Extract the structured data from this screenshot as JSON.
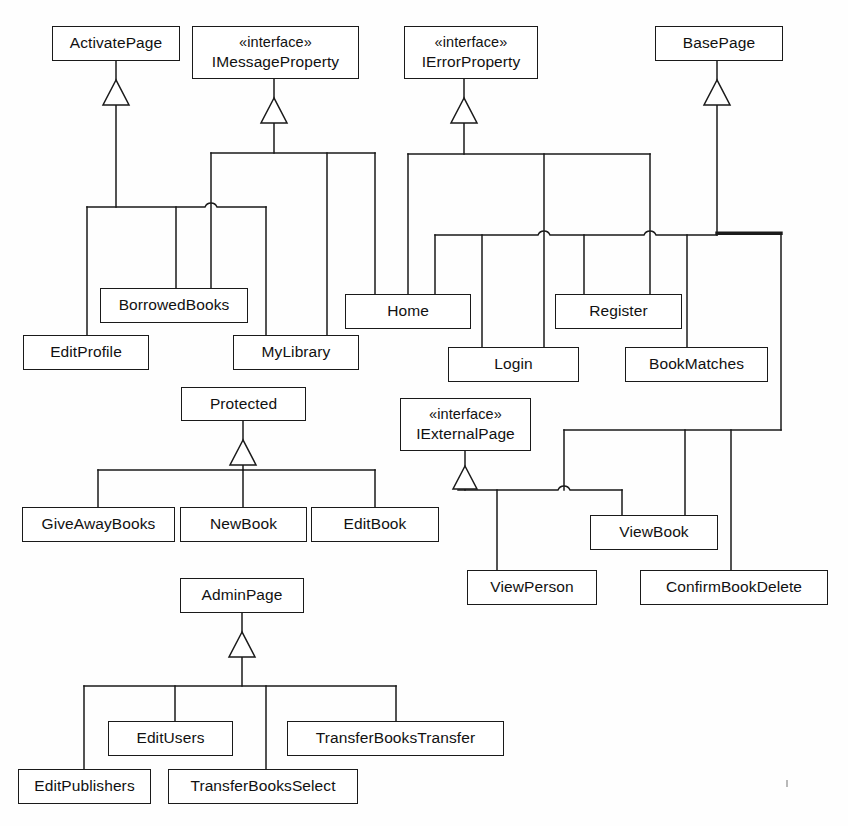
{
  "diagram": {
    "type": "uml-class-inheritance",
    "background_color": "#fefefe",
    "line_color": "#1a1a1a",
    "box_fill": "#ffffff",
    "stereotype_label": "«interface»"
  },
  "nodes": [
    {
      "id": "activatepage",
      "name": "ActivatePage",
      "stereotype": "",
      "kind": "class",
      "x": 52,
      "y": 26,
      "w": 128,
      "h": 35
    },
    {
      "id": "imessageproperty",
      "name": "IMessageProperty",
      "stereotype": "«interface»",
      "kind": "interface",
      "x": 192,
      "y": 26,
      "w": 167,
      "h": 53
    },
    {
      "id": "ierrorproperty",
      "name": "IErrorProperty",
      "stereotype": "«interface»",
      "kind": "interface",
      "x": 404,
      "y": 26,
      "w": 134,
      "h": 53
    },
    {
      "id": "basepage",
      "name": "BasePage",
      "stereotype": "",
      "kind": "class",
      "x": 655,
      "y": 26,
      "w": 128,
      "h": 35
    },
    {
      "id": "borrowedbooks",
      "name": "BorrowedBooks",
      "stereotype": "",
      "kind": "class",
      "x": 100,
      "y": 288,
      "w": 148,
      "h": 35
    },
    {
      "id": "home",
      "name": "Home",
      "stereotype": "",
      "kind": "class",
      "x": 345,
      "y": 294,
      "w": 126,
      "h": 35
    },
    {
      "id": "register",
      "name": "Register",
      "stereotype": "",
      "kind": "class",
      "x": 555,
      "y": 294,
      "w": 127,
      "h": 35
    },
    {
      "id": "editprofile",
      "name": "EditProfile",
      "stereotype": "",
      "kind": "class",
      "x": 23,
      "y": 335,
      "w": 126,
      "h": 35
    },
    {
      "id": "mylibrary",
      "name": "MyLibrary",
      "stereotype": "",
      "kind": "class",
      "x": 233,
      "y": 335,
      "w": 126,
      "h": 35
    },
    {
      "id": "login",
      "name": "Login",
      "stereotype": "",
      "kind": "class",
      "x": 448,
      "y": 347,
      "w": 131,
      "h": 35
    },
    {
      "id": "bookmatches",
      "name": "BookMatches",
      "stereotype": "",
      "kind": "class",
      "x": 625,
      "y": 347,
      "w": 143,
      "h": 35
    },
    {
      "id": "protected",
      "name": "Protected",
      "stereotype": "",
      "kind": "class",
      "x": 181,
      "y": 387,
      "w": 125,
      "h": 34
    },
    {
      "id": "iexternalpage",
      "name": "IExternalPage",
      "stereotype": "«interface»",
      "kind": "interface",
      "x": 400,
      "y": 398,
      "w": 131,
      "h": 53
    },
    {
      "id": "giveawaybooks",
      "name": "GiveAwayBooks",
      "stereotype": "",
      "kind": "class",
      "x": 22,
      "y": 507,
      "w": 153,
      "h": 35
    },
    {
      "id": "newbook",
      "name": "NewBook",
      "stereotype": "",
      "kind": "class",
      "x": 180,
      "y": 507,
      "w": 127,
      "h": 35
    },
    {
      "id": "editbook",
      "name": "EditBook",
      "stereotype": "",
      "kind": "class",
      "x": 311,
      "y": 507,
      "w": 128,
      "h": 35
    },
    {
      "id": "viewbook",
      "name": "ViewBook",
      "stereotype": "",
      "kind": "class",
      "x": 590,
      "y": 515,
      "w": 128,
      "h": 35
    },
    {
      "id": "viewperson",
      "name": "ViewPerson",
      "stereotype": "",
      "kind": "class",
      "x": 467,
      "y": 570,
      "w": 130,
      "h": 35
    },
    {
      "id": "confirmbookdelete",
      "name": "ConfirmBookDelete",
      "stereotype": "",
      "kind": "class",
      "x": 640,
      "y": 570,
      "w": 188,
      "h": 35
    },
    {
      "id": "adminpage",
      "name": "AdminPage",
      "stereotype": "",
      "kind": "class",
      "x": 180,
      "y": 578,
      "w": 124,
      "h": 35
    },
    {
      "id": "editusers",
      "name": "EditUsers",
      "stereotype": "",
      "kind": "class",
      "x": 108,
      "y": 721,
      "w": 125,
      "h": 35
    },
    {
      "id": "transferbookstransfer",
      "name": "TransferBooksTransfer",
      "stereotype": "",
      "kind": "class",
      "x": 287,
      "y": 721,
      "w": 217,
      "h": 35
    },
    {
      "id": "editpublishers",
      "name": "EditPublishers",
      "stereotype": "",
      "kind": "class",
      "x": 18,
      "y": 769,
      "w": 133,
      "h": 35
    },
    {
      "id": "transferbooksselect",
      "name": "TransferBooksSelect",
      "stereotype": "",
      "kind": "class",
      "x": 168,
      "y": 769,
      "w": 190,
      "h": 35
    }
  ],
  "generalizations": [
    {
      "parent": "activatepage",
      "children": [
        "editprofile",
        "borrowedbooks",
        "mylibrary"
      ]
    },
    {
      "parent": "imessageproperty",
      "children": [
        "borrowedbooks",
        "mylibrary",
        "home"
      ]
    },
    {
      "parent": "ierrorproperty",
      "children": [
        "home",
        "login",
        "register"
      ]
    },
    {
      "parent": "basepage",
      "children": [
        "home",
        "login",
        "register",
        "bookmatches",
        "viewperson",
        "viewbook",
        "confirmbookdelete"
      ]
    },
    {
      "parent": "protected",
      "children": [
        "giveawaybooks",
        "newbook",
        "editbook"
      ]
    },
    {
      "parent": "iexternalpage",
      "children": [
        "viewperson",
        "viewbook"
      ]
    },
    {
      "parent": "adminpage",
      "children": [
        "editpublishers",
        "editusers",
        "transferbooksselect",
        "transferbookstransfer"
      ]
    }
  ]
}
